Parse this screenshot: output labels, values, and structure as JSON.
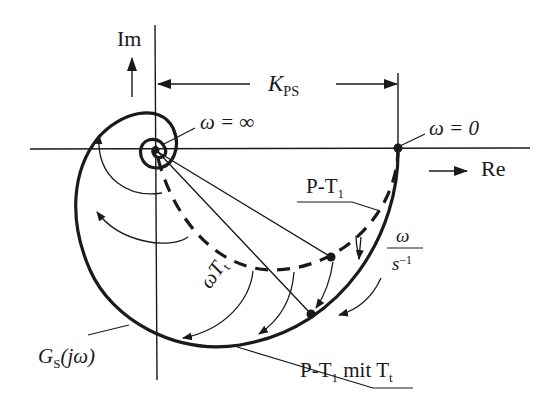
{
  "axes": {
    "imaginary_label": "Im",
    "real_label": "Re"
  },
  "annotations": {
    "gain": {
      "symbol": "K",
      "subscript": "PS"
    },
    "omega_infinity": "ω = ∞",
    "omega_zero": "ω = 0",
    "curve_pt1": {
      "text": "P-T",
      "subscript": "1"
    },
    "curve_pt1_tt": {
      "text": "P-T",
      "subscript": "1",
      "suffix": " mit T",
      "suffix_subscript": "t"
    },
    "frequency_unit": {
      "numerator": "ω",
      "denominator": "s",
      "exponent": "−1"
    },
    "phase_shift": {
      "text": "ωT",
      "subscript": "t"
    },
    "transfer_function": {
      "symbol": "G",
      "subscript": "S",
      "argument": "(jω)"
    }
  },
  "colors": {
    "ink": "#1a1a1a",
    "background": "#ffffff"
  }
}
